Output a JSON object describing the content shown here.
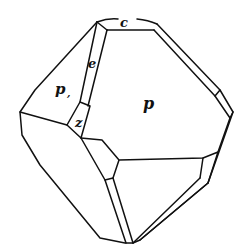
{
  "diagram": {
    "type": "crystal-drawing",
    "stroke_color": "#111111",
    "background": "#ffffff",
    "labels": {
      "c": "c",
      "e": "e",
      "p": "p",
      "p1": "p",
      "p1_subscript": ",",
      "z": "z"
    }
  }
}
